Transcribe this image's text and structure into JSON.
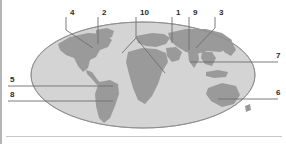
{
  "figure": {
    "kind": "labeled-world-map-diagram",
    "title": "",
    "background_color": "#ffffff",
    "ocean_color": "#d4d4d4",
    "land_color": "#9a9a9a",
    "outline_color": "#8c8c8c",
    "leader_line_color": "#6e6e6e",
    "label_color": "#2b2b2b",
    "left_rule_color": "#b5b5b5",
    "bottom_rule_color": "#c9c9c9"
  },
  "callouts": [
    {
      "id": "4",
      "label": "4",
      "label_x": 70,
      "label_y": 15,
      "tick_x": 66,
      "anchor_x": 93,
      "anchor_y": 48,
      "side": "top"
    },
    {
      "id": "2",
      "label": "2",
      "label_x": 102,
      "label_y": 15,
      "tick_x": 98,
      "anchor_x": 98,
      "anchor_y": 44,
      "side": "top"
    },
    {
      "id": "10",
      "label": "10",
      "label_x": 140,
      "label_y": 15,
      "tick_x": 136,
      "anchor_x": 165,
      "anchor_y": 73,
      "side": "top"
    },
    {
      "id": "1",
      "label": "1",
      "label_x": 176,
      "label_y": 15,
      "tick_x": 172,
      "anchor_x": 172,
      "anchor_y": 43,
      "side": "top"
    },
    {
      "id": "9",
      "label": "9",
      "label_x": 193,
      "label_y": 15,
      "tick_x": 189,
      "anchor_x": 189,
      "anchor_y": 50,
      "side": "top"
    },
    {
      "id": "3",
      "label": "3",
      "label_x": 219,
      "label_y": 15,
      "tick_x": 215,
      "anchor_x": 196,
      "anchor_y": 48,
      "side": "top"
    },
    {
      "id": "5",
      "label": "5",
      "label_x": 10,
      "label_y": 82,
      "rule_y": 86,
      "anchor_x": 113,
      "side": "left"
    },
    {
      "id": "8",
      "label": "8",
      "label_x": 10,
      "label_y": 97,
      "rule_y": 101,
      "anchor_x": 113,
      "side": "left"
    },
    {
      "id": "7",
      "label": "7",
      "label_x": 276,
      "label_y": 58,
      "rule_y": 62,
      "anchor_x": 190,
      "side": "right"
    },
    {
      "id": "6",
      "label": "6",
      "label_x": 276,
      "label_y": 95,
      "rule_y": 99,
      "anchor_x": 218,
      "side": "right"
    }
  ],
  "map": {
    "projection": "elliptical",
    "ellipse_center_x": 143,
    "ellipse_center_y": 75,
    "ellipse_radius_x": 112,
    "ellipse_radius_y": 53,
    "landmasses": [
      "north-america",
      "south-america",
      "europe",
      "africa",
      "asia",
      "australia",
      "greenland"
    ]
  }
}
